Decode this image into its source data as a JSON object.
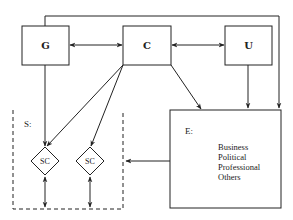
{
  "diagram": {
    "nodes": {
      "G": {
        "label": "G"
      },
      "C": {
        "label": "C"
      },
      "U": {
        "label": "U"
      },
      "E": {
        "label": "E:",
        "items": [
          "Business",
          "Political",
          "Professional",
          "Others"
        ]
      },
      "S": {
        "label": "S:"
      },
      "SC1": {
        "label": "SC"
      },
      "SC2": {
        "label": "SC"
      }
    },
    "edges": [
      {
        "from": "G",
        "to": "C",
        "type": "bidirectional"
      },
      {
        "from": "C",
        "to": "U",
        "type": "bidirectional"
      },
      {
        "from": "G",
        "to": "E",
        "type": "directed",
        "route": "top-line"
      },
      {
        "from": "G",
        "to": "SC1",
        "type": "directed"
      },
      {
        "from": "C",
        "to": "SC1",
        "type": "directed"
      },
      {
        "from": "C",
        "to": "SC2",
        "type": "directed"
      },
      {
        "from": "C",
        "to": "E",
        "type": "directed"
      },
      {
        "from": "U",
        "to": "E",
        "type": "directed"
      },
      {
        "from": "E",
        "to": "S",
        "type": "directed"
      },
      {
        "from": "SC1",
        "to": "S-boundary",
        "type": "bidirectional"
      },
      {
        "from": "SC2",
        "to": "S-boundary",
        "type": "bidirectional"
      }
    ],
    "colors": {
      "stroke": "#222222",
      "background": "#ffffff"
    }
  }
}
